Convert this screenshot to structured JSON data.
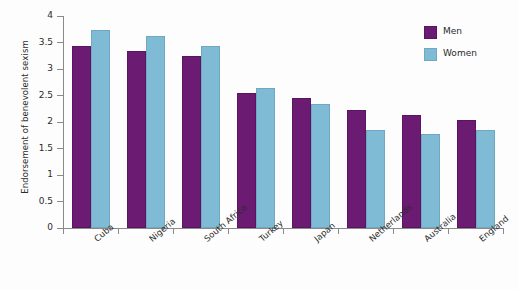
{
  "chart_data": {
    "type": "bar",
    "title": "",
    "subtitle": "",
    "xlabel": "",
    "ylabel": "Endorsement of benevolent sexism",
    "ylim": [
      0,
      4
    ],
    "yticks": [
      "0",
      "0.5",
      "1",
      "1.5",
      "2",
      "2.5",
      "3",
      "3.5",
      "4"
    ],
    "ytick_values": [
      0,
      0.5,
      1,
      1.5,
      2,
      2.5,
      3,
      3.5,
      4
    ],
    "grid": false,
    "legend_position": "top-right",
    "categories": [
      "Cuba",
      "Nigeria",
      "South Africa",
      "Turkey",
      "Japan",
      "Netherlands",
      "Australia",
      "England"
    ],
    "series": [
      {
        "name": "Men",
        "color": "#6B1C72",
        "values": [
          3.43,
          3.34,
          3.24,
          2.55,
          2.45,
          2.22,
          2.13,
          2.03
        ]
      },
      {
        "name": "Women",
        "color": "#7FBBD4",
        "values": [
          3.73,
          3.63,
          3.44,
          2.65,
          2.34,
          1.85,
          1.77,
          1.85
        ]
      }
    ]
  },
  "legend": {
    "items": [
      {
        "label": "Men",
        "color": "#6B1C72"
      },
      {
        "label": "Women",
        "color": "#7FBBD4"
      }
    ]
  }
}
